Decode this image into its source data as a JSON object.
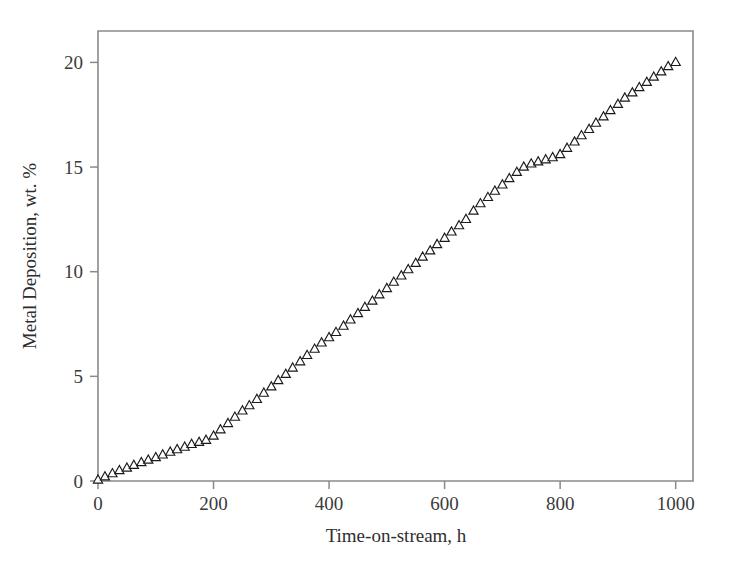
{
  "chart_data": {
    "type": "scatter",
    "title": "",
    "xlabel": "Time-on-stream, h",
    "ylabel": "Metal Deposition, wt. %",
    "xlim": [
      0,
      1030
    ],
    "ylim": [
      0,
      21.5
    ],
    "xticks": [
      0,
      200,
      400,
      600,
      800,
      1000
    ],
    "xtick_labels": [
      "0",
      "200",
      "400",
      "600",
      "800",
      "1000"
    ],
    "yticks": [
      0,
      5,
      10,
      15,
      20
    ],
    "ytick_labels": [
      "0",
      "5",
      "10",
      "15",
      "20"
    ],
    "grid": false,
    "legend": null,
    "marker": "open-triangle-up",
    "marker_fill": "#ffffff",
    "marker_edge_color": "#1a1a1a",
    "frame_color": "#8a8a8a",
    "series": [
      {
        "name": "Metal Deposition",
        "x": [
          0,
          12,
          25,
          37,
          50,
          62,
          75,
          87,
          100,
          112,
          125,
          137,
          150,
          162,
          175,
          187,
          200,
          212,
          225,
          237,
          250,
          262,
          275,
          287,
          300,
          312,
          325,
          337,
          350,
          362,
          375,
          387,
          400,
          412,
          425,
          437,
          450,
          462,
          475,
          487,
          500,
          512,
          525,
          537,
          550,
          562,
          575,
          587,
          600,
          612,
          625,
          637,
          650,
          662,
          675,
          687,
          700,
          712,
          725,
          737,
          750,
          762,
          775,
          787,
          800,
          812,
          825,
          837,
          850,
          862,
          875,
          887,
          900,
          912,
          925,
          937,
          950,
          962,
          975,
          987,
          1000
        ],
        "y": [
          0.05,
          0.2,
          0.35,
          0.5,
          0.62,
          0.75,
          0.88,
          1.0,
          1.12,
          1.25,
          1.38,
          1.5,
          1.62,
          1.75,
          1.85,
          1.95,
          2.15,
          2.45,
          2.75,
          3.05,
          3.35,
          3.6,
          3.9,
          4.2,
          4.5,
          4.8,
          5.1,
          5.4,
          5.7,
          6.0,
          6.3,
          6.6,
          6.85,
          7.1,
          7.4,
          7.7,
          8.0,
          8.3,
          8.6,
          8.9,
          9.2,
          9.5,
          9.8,
          10.1,
          10.4,
          10.7,
          11.0,
          11.3,
          11.6,
          11.9,
          12.2,
          12.5,
          12.9,
          13.25,
          13.55,
          13.85,
          14.15,
          14.45,
          14.75,
          15.0,
          15.15,
          15.25,
          15.35,
          15.45,
          15.6,
          15.9,
          16.2,
          16.5,
          16.8,
          17.1,
          17.4,
          17.7,
          18.0,
          18.3,
          18.55,
          18.8,
          19.05,
          19.3,
          19.55,
          19.8,
          20.0
        ]
      }
    ]
  }
}
